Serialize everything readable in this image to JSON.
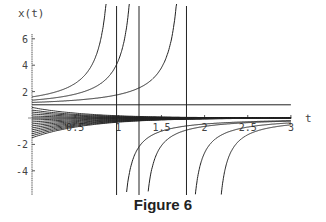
{
  "caption": "Figure 6",
  "chart_data": {
    "type": "line",
    "title": "",
    "xlabel": "t",
    "ylabel": "x(t)",
    "xlim": [
      0,
      3
    ],
    "ylim": [
      -5.8,
      6.5
    ],
    "x_ticks": [
      "0.5",
      "1",
      "1.5",
      "2",
      "2.5",
      "3"
    ],
    "y_ticks": [
      "-4",
      "-2",
      "2",
      "4",
      "6"
    ],
    "grid": false,
    "legend": null,
    "equilibrium": 1,
    "vertical_asymptotes_t": [
      0.98,
      1.24,
      1.79
    ],
    "initial_values": [
      1.6,
      1.4,
      1.2,
      1.0,
      0.8,
      0.6,
      0.45,
      0.3,
      0.15,
      0.0,
      -0.15,
      -0.3,
      -0.45,
      -0.6,
      -0.75,
      -0.9,
      -1.05,
      -1.2,
      -1.35,
      -1.5
    ],
    "lower_branches_start_t": [
      1.0,
      1.25,
      1.8,
      2.1
    ]
  },
  "axis": {
    "x_label": "t",
    "y_label": "x(t)"
  }
}
